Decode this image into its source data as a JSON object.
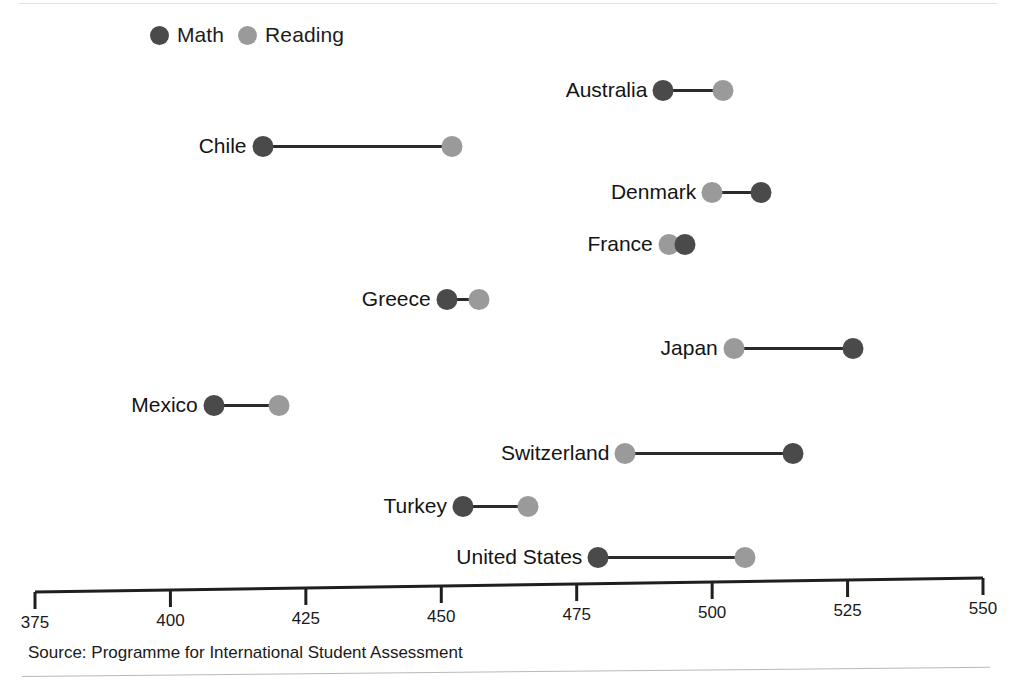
{
  "colors": {
    "math": "#4a4a4a",
    "reading": "#9a9a9a",
    "connector": "#2b2b2b",
    "axis": "#1f1f1f",
    "text": "#1a1a1a"
  },
  "legend": {
    "position": "top-left",
    "entries": [
      {
        "label": "Math",
        "color_key": "math",
        "icon": "circle-dot-icon"
      },
      {
        "label": "Reading",
        "color_key": "reading",
        "icon": "circle-dot-icon"
      }
    ]
  },
  "axis": {
    "min": 375,
    "max": 550,
    "step": 25,
    "ticks": [
      375,
      400,
      425,
      450,
      475,
      500,
      525,
      550
    ],
    "tick_labels": [
      "375",
      "400",
      "425",
      "450",
      "475",
      "500",
      "525",
      "550"
    ]
  },
  "source": "Source: Programme for International Student Assessment",
  "chart_data": {
    "type": "scatter",
    "subtype": "dumbbell",
    "title": "",
    "subtitle": "",
    "xlabel": "",
    "ylabel": "",
    "xlim": [
      375,
      550
    ],
    "grid": false,
    "legend_position": "top-left",
    "categories": [
      "Australia",
      "Chile",
      "Denmark",
      "France",
      "Greece",
      "Japan",
      "Mexico",
      "Switzerland",
      "Turkey",
      "United States"
    ],
    "series": [
      {
        "name": "Math",
        "color": "#4a4a4a",
        "values": [
          491,
          417,
          509,
          495,
          451,
          526,
          408,
          515,
          454,
          479
        ]
      },
      {
        "name": "Reading",
        "color": "#9a9a9a",
        "values": [
          502,
          452,
          500,
          492,
          457,
          504,
          420,
          484,
          466,
          506
        ]
      }
    ],
    "annotations": [
      "Source: Programme for International Student Assessment"
    ]
  }
}
